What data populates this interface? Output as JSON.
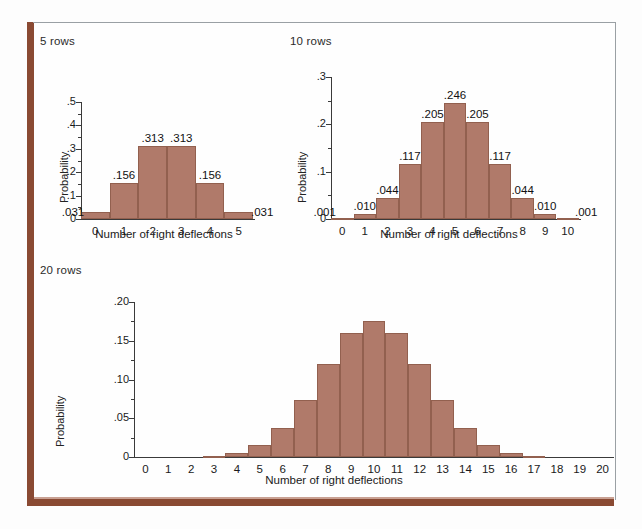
{
  "figure": {
    "bar_color": "#b07a6a",
    "bar_edge_color": "#92604f",
    "frame_color": "#8a4a33",
    "background": "#fefefe"
  },
  "charts": [
    {
      "id": "chart-5-rows",
      "title": "5 rows",
      "type": "bar",
      "xlabel": "Number of right deflections",
      "ylabel": "Probability",
      "categories": [
        "0",
        "1",
        "2",
        "3",
        "4",
        "5"
      ],
      "values": [
        0.031,
        0.156,
        0.313,
        0.313,
        0.156,
        0.031
      ],
      "value_labels": [
        ".031",
        ".156",
        ".313",
        ".313",
        ".156",
        ".031"
      ],
      "yticks": [
        "0",
        ".1",
        ".2",
        ".3",
        ".4",
        ".5"
      ],
      "ytick_values": [
        0,
        0.1,
        0.2,
        0.3,
        0.4,
        0.5
      ],
      "ylim": [
        0,
        0.5
      ],
      "grid": false,
      "legend": "none"
    },
    {
      "id": "chart-10-rows",
      "title": "10 rows",
      "type": "bar",
      "xlabel": "Number of right deflections",
      "ylabel": "Probability",
      "categories": [
        "0",
        "1",
        "2",
        "3",
        "4",
        "5",
        "6",
        "7",
        "8",
        "9",
        "10"
      ],
      "values": [
        0.001,
        0.01,
        0.044,
        0.117,
        0.205,
        0.246,
        0.205,
        0.117,
        0.044,
        0.01,
        0.001
      ],
      "value_labels": [
        ".001",
        ".010",
        ".044",
        ".117",
        ".205",
        ".246",
        ".205",
        ".117",
        ".044",
        ".010",
        ".001"
      ],
      "yticks": [
        "0",
        ".1",
        ".2",
        ".3"
      ],
      "ytick_values": [
        0,
        0.1,
        0.2,
        0.3
      ],
      "ylim": [
        0,
        0.3
      ],
      "grid": false,
      "legend": "none"
    },
    {
      "id": "chart-20-rows",
      "title": "20 rows",
      "type": "bar",
      "xlabel": "Number of right deflections",
      "ylabel": "Probability",
      "categories": [
        "0",
        "1",
        "2",
        "3",
        "4",
        "5",
        "6",
        "7",
        "8",
        "9",
        "10",
        "11",
        "12",
        "13",
        "14",
        "15",
        "16",
        "17",
        "18",
        "19",
        "20"
      ],
      "values": [
        0.0,
        0.0,
        0.0,
        0.001,
        0.005,
        0.015,
        0.037,
        0.074,
        0.12,
        0.16,
        0.176,
        0.16,
        0.12,
        0.074,
        0.037,
        0.015,
        0.005,
        0.001,
        0.0,
        0.0,
        0.0
      ],
      "value_labels": [
        "",
        "",
        "",
        "",
        "",
        "",
        "",
        "",
        "",
        "",
        "",
        "",
        "",
        "",
        "",
        "",
        "",
        "",
        "",
        "",
        ""
      ],
      "yticks": [
        "0",
        ".05",
        ".10",
        ".15",
        ".20"
      ],
      "ytick_values": [
        0,
        0.05,
        0.1,
        0.15,
        0.2
      ],
      "ylim": [
        0,
        0.2
      ],
      "grid": false,
      "legend": "none"
    }
  ],
  "chart_data": [
    {
      "type": "bar",
      "title": "5 rows",
      "xlabel": "Number of right deflections",
      "ylabel": "Probability",
      "categories": [
        "0",
        "1",
        "2",
        "3",
        "4",
        "5"
      ],
      "values": [
        0.031,
        0.156,
        0.313,
        0.313,
        0.156,
        0.031
      ],
      "ylim": [
        0,
        0.5
      ],
      "yticks": [
        0,
        0.1,
        0.2,
        0.3,
        0.4,
        0.5
      ],
      "grid": false,
      "legend": "none",
      "annotations": [
        ".031",
        ".156",
        ".313",
        ".313",
        ".156",
        ".031"
      ]
    },
    {
      "type": "bar",
      "title": "10 rows",
      "xlabel": "Number of right deflections",
      "ylabel": "Probability",
      "categories": [
        "0",
        "1",
        "2",
        "3",
        "4",
        "5",
        "6",
        "7",
        "8",
        "9",
        "10"
      ],
      "values": [
        0.001,
        0.01,
        0.044,
        0.117,
        0.205,
        0.246,
        0.205,
        0.117,
        0.044,
        0.01,
        0.001
      ],
      "ylim": [
        0,
        0.3
      ],
      "yticks": [
        0,
        0.1,
        0.2,
        0.3
      ],
      "grid": false,
      "legend": "none",
      "annotations": [
        ".001",
        ".010",
        ".044",
        ".117",
        ".205",
        ".246",
        ".205",
        ".117",
        ".044",
        ".010",
        ".001"
      ]
    },
    {
      "type": "bar",
      "title": "20 rows",
      "xlabel": "Number of right deflections",
      "ylabel": "Probability",
      "categories": [
        "0",
        "1",
        "2",
        "3",
        "4",
        "5",
        "6",
        "7",
        "8",
        "9",
        "10",
        "11",
        "12",
        "13",
        "14",
        "15",
        "16",
        "17",
        "18",
        "19",
        "20"
      ],
      "values": [
        0.0,
        0.0,
        0.0,
        0.001,
        0.005,
        0.015,
        0.037,
        0.074,
        0.12,
        0.16,
        0.176,
        0.16,
        0.12,
        0.074,
        0.037,
        0.015,
        0.005,
        0.001,
        0.0,
        0.0,
        0.0
      ],
      "ylim": [
        0,
        0.2
      ],
      "yticks": [
        0,
        0.05,
        0.1,
        0.15,
        0.2
      ],
      "grid": false,
      "legend": "none",
      "annotations": []
    }
  ]
}
